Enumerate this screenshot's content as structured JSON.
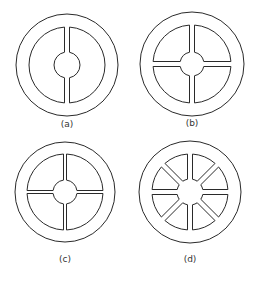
{
  "figure": {
    "stroke_color": "#2a2a2a",
    "background": "#ffffff",
    "panels": [
      {
        "id": "a",
        "label": "(a)",
        "cx": 67,
        "cy": 65,
        "outer_r": 51,
        "inner_r": 38,
        "hub_r": 13,
        "hub_circle": true,
        "spoke_count": 2,
        "spoke_angles": [
          90,
          270
        ],
        "spoke_half_width": 2.5,
        "label_y": 127
      },
      {
        "id": "b",
        "label": "(b)",
        "cx": 192,
        "cy": 64,
        "outer_r": 52,
        "inner_r": 39,
        "hub_r": 12,
        "hub_circle": true,
        "spoke_count": 4,
        "spoke_angles": [
          0,
          90,
          180,
          270
        ],
        "spoke_half_width": 2.5,
        "label_y": 126
      },
      {
        "id": "c",
        "label": "(c)",
        "cx": 65,
        "cy": 192,
        "outer_r": 50,
        "inner_r": 38,
        "hub_r": 12,
        "hub_circle": true,
        "spoke_count": 4,
        "spoke_angles": [
          0,
          90,
          180,
          270
        ],
        "spoke_half_width": 1.5,
        "label_y": 262
      },
      {
        "id": "d",
        "label": "(d)",
        "cx": 190,
        "cy": 192,
        "outer_r": 51,
        "inner_r": 38,
        "hub_r": 13,
        "hub_circle": false,
        "spoke_count": 8,
        "spoke_angles": [
          0,
          45,
          90,
          135,
          180,
          225,
          270,
          315
        ],
        "spoke_half_width": 2.5,
        "label_y": 262
      }
    ]
  }
}
